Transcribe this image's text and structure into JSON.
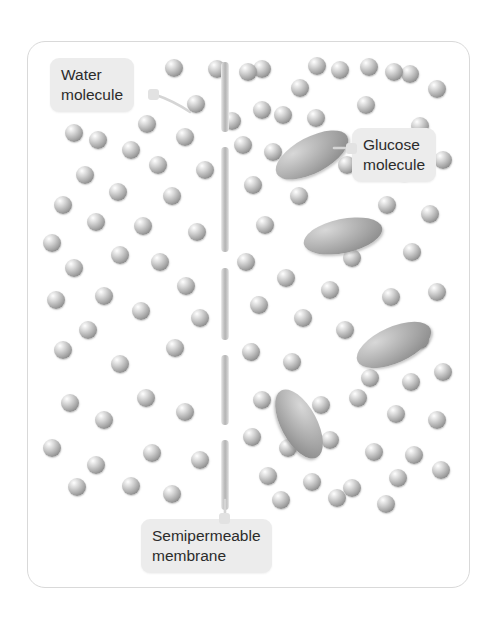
{
  "diagram": {
    "frame": {
      "x": 27,
      "y": 41,
      "width": 443,
      "height": 547,
      "border_color": "#d9d9d9",
      "radius": 18
    },
    "background_color": "#ffffff"
  },
  "labels": {
    "water": {
      "line1": "Water",
      "line2": "molecule",
      "x": 50,
      "y": 58,
      "nub_side": "right"
    },
    "glucose": {
      "line1": "Glucose",
      "line2": "molecule",
      "x": 352,
      "y": 128,
      "nub_side": "left"
    },
    "membrane": {
      "line1": "Semipermeable",
      "line2": "membrane",
      "x": 141,
      "y": 519,
      "nub_side": "top"
    }
  },
  "colors": {
    "label_background": "#ececec",
    "label_text": "#2b2b2b",
    "membrane": "#b4b4b4",
    "sphere_body": "#a9a9a9",
    "sphere_highlight": "#ffffff",
    "glucose_body": "#a4a4a4",
    "frame_border": "#d9d9d9"
  },
  "membrane": {
    "x": 221,
    "width": 8,
    "segments": [
      {
        "y": 62,
        "height": 70
      },
      {
        "y": 147,
        "height": 105
      },
      {
        "y": 268,
        "height": 72
      },
      {
        "y": 355,
        "height": 70
      },
      {
        "y": 440,
        "height": 70
      }
    ],
    "pore_gaps": 4
  },
  "molecules": {
    "water_count_left": 44,
    "water_count_right": 46,
    "sphere_diameter": 18,
    "left_side": [
      [
        174,
        68
      ],
      [
        217,
        69
      ],
      [
        262,
        69
      ],
      [
        317,
        66
      ],
      [
        369,
        67
      ],
      [
        410,
        74
      ],
      [
        114,
        93
      ],
      [
        196,
        104
      ],
      [
        147,
        124
      ],
      [
        232,
        121
      ],
      [
        283,
        115
      ],
      [
        74,
        133
      ],
      [
        98,
        140
      ],
      [
        185,
        137
      ],
      [
        243,
        145
      ],
      [
        131,
        150
      ],
      [
        85,
        175
      ],
      [
        158,
        165
      ],
      [
        205,
        170
      ],
      [
        118,
        192
      ],
      [
        63,
        205
      ],
      [
        172,
        196
      ],
      [
        96,
        222
      ],
      [
        143,
        226
      ],
      [
        52,
        243
      ],
      [
        197,
        232
      ],
      [
        120,
        255
      ],
      [
        74,
        268
      ],
      [
        160,
        262
      ],
      [
        186,
        286
      ],
      [
        104,
        296
      ],
      [
        56,
        300
      ],
      [
        141,
        311
      ],
      [
        200,
        318
      ],
      [
        88,
        330
      ],
      [
        63,
        350
      ],
      [
        175,
        348
      ],
      [
        120,
        364
      ],
      [
        146,
        398
      ],
      [
        70,
        403
      ],
      [
        104,
        420
      ],
      [
        185,
        412
      ],
      [
        52,
        448
      ],
      [
        152,
        453
      ],
      [
        96,
        465
      ],
      [
        200,
        460
      ],
      [
        131,
        486
      ],
      [
        77,
        487
      ],
      [
        172,
        494
      ]
    ],
    "right_side": [
      [
        248,
        72
      ],
      [
        300,
        88
      ],
      [
        340,
        70
      ],
      [
        394,
        72
      ],
      [
        437,
        89
      ],
      [
        262,
        110
      ],
      [
        316,
        118
      ],
      [
        366,
        105
      ],
      [
        420,
        126
      ],
      [
        273,
        152
      ],
      [
        347,
        165
      ],
      [
        404,
        172
      ],
      [
        443,
        160
      ],
      [
        253,
        185
      ],
      [
        299,
        196
      ],
      [
        387,
        205
      ],
      [
        430,
        214
      ],
      [
        265,
        225
      ],
      [
        318,
        237
      ],
      [
        352,
        258
      ],
      [
        412,
        252
      ],
      [
        246,
        262
      ],
      [
        286,
        278
      ],
      [
        330,
        290
      ],
      [
        391,
        297
      ],
      [
        437,
        292
      ],
      [
        259,
        305
      ],
      [
        303,
        318
      ],
      [
        345,
        330
      ],
      [
        420,
        340
      ],
      [
        251,
        352
      ],
      [
        292,
        362
      ],
      [
        370,
        378
      ],
      [
        411,
        382
      ],
      [
        443,
        372
      ],
      [
        262,
        400
      ],
      [
        321,
        405
      ],
      [
        358,
        398
      ],
      [
        396,
        414
      ],
      [
        437,
        420
      ],
      [
        252,
        437
      ],
      [
        288,
        448
      ],
      [
        330,
        440
      ],
      [
        374,
        452
      ],
      [
        414,
        455
      ],
      [
        268,
        476
      ],
      [
        312,
        482
      ],
      [
        352,
        488
      ],
      [
        398,
        478
      ],
      [
        441,
        470
      ],
      [
        281,
        500
      ],
      [
        337,
        498
      ],
      [
        386,
        504
      ]
    ],
    "glucose_ellipses": [
      {
        "cx": 312,
        "cy": 155,
        "rx": 40,
        "ry": 18,
        "angle": -28
      },
      {
        "cx": 343,
        "cy": 236,
        "rx": 40,
        "ry": 17,
        "angle": -12
      },
      {
        "cx": 394,
        "cy": 345,
        "rx": 40,
        "ry": 18,
        "angle": -24
      },
      {
        "cx": 299,
        "cy": 424,
        "rx": 38,
        "ry": 18,
        "angle": 62
      }
    ]
  }
}
